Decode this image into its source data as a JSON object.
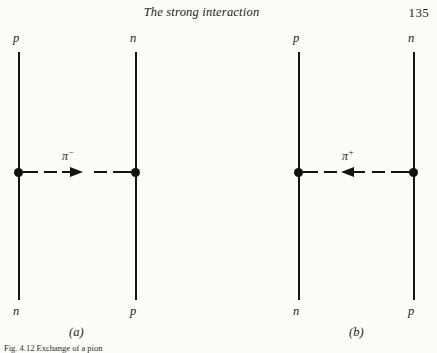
{
  "page": {
    "background_color": "#fdfdf8",
    "ink_color": "#141412"
  },
  "running_head": {
    "title": "The strong interaction",
    "folio": "135"
  },
  "figure": {
    "caption": "Fig. 4.12 Exchange of a pion",
    "diagrams": [
      {
        "id": "a",
        "panel_label": "(a)",
        "left_line": {
          "top_label": "p",
          "bottom_label": "n"
        },
        "right_line": {
          "top_label": "n",
          "bottom_label": "p"
        },
        "exchange": {
          "particle": "π",
          "charge": "−",
          "direction": "right"
        }
      },
      {
        "id": "b",
        "panel_label": "(b)",
        "left_line": {
          "top_label": "p",
          "bottom_label": "n"
        },
        "right_line": {
          "top_label": "n",
          "bottom_label": "p"
        },
        "exchange": {
          "particle": "π",
          "charge": "+",
          "direction": "left"
        }
      }
    ]
  }
}
